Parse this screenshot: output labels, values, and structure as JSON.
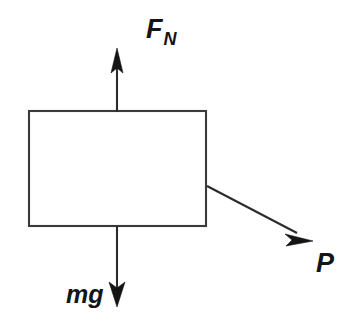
{
  "figure": {
    "kind": "free-body-diagram",
    "background_color": "#ffffff",
    "line_color": "#231f20",
    "box_fill": "#ffffff",
    "box_stroke": "#3a3a3c",
    "canvas": {
      "width": 362,
      "height": 336
    }
  },
  "body": {
    "name": "block",
    "shape": "rectangle",
    "x": 29,
    "y": 111,
    "width": 177,
    "height": 115
  },
  "vectors": [
    {
      "id": "normal-force",
      "label_main": "F",
      "label_sub": "N",
      "label_full": "F_N",
      "direction": "up",
      "start_x": 117,
      "start_y": 111,
      "end_x": 117,
      "end_y": 50,
      "label_x": 146,
      "label_y": 38
    },
    {
      "id": "weight",
      "label_main": "mg",
      "label_sub": "",
      "label_full": "mg",
      "direction": "down",
      "start_x": 117,
      "start_y": 226,
      "end_x": 117,
      "end_y": 306,
      "label_x": 66,
      "label_y": 303
    },
    {
      "id": "applied-force",
      "label_main": "P",
      "label_sub": "",
      "label_full": "P",
      "direction": "down-right",
      "start_x": 207,
      "start_y": 186,
      "end_x": 312,
      "end_y": 241,
      "label_x": 316,
      "label_y": 272
    }
  ]
}
